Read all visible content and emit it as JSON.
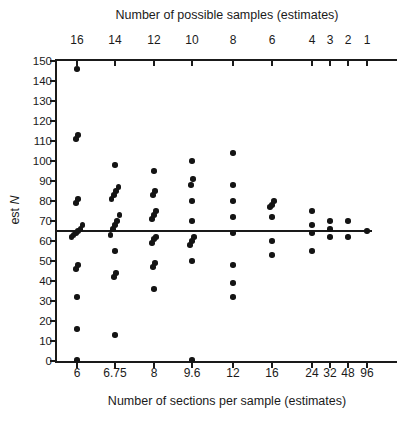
{
  "chart_data": {
    "type": "scatter",
    "top_axis_title": "Number of possible samples (estimates)",
    "bottom_axis_title": "Number of sections per sample (estimates)",
    "ylabel_prefix": "est ",
    "ylabel_symbol": "N",
    "ylim": [
      0,
      150
    ],
    "y_tick_step": 10,
    "y_tick_labels": [
      "0",
      "10",
      "20",
      "30",
      "40",
      "50",
      "60",
      "70",
      "80",
      "90",
      "100",
      "110",
      "120",
      "130",
      "140",
      "150"
    ],
    "top_tick_labels": [
      "16",
      "14",
      "12",
      "10",
      "8",
      "6",
      "4",
      "3",
      "2",
      "1"
    ],
    "bottom_tick_labels": [
      "6",
      "6.75",
      "8",
      "9.6",
      "12",
      "16",
      "24",
      "32",
      "48",
      "96"
    ],
    "reference_line_y": 65,
    "grid": false,
    "point_color": "#141414",
    "series": [
      {
        "sections_per_sample": "6",
        "possible_samples": 16,
        "est_N_values": [
          0.5,
          16,
          32,
          46,
          48,
          62,
          63,
          64,
          65,
          66,
          68,
          79,
          81,
          111,
          113,
          146
        ]
      },
      {
        "sections_per_sample": "6.75",
        "possible_samples": 14,
        "est_N_values": [
          13,
          42,
          44,
          55,
          63,
          66,
          68,
          70,
          73,
          81,
          83,
          85,
          87,
          98
        ]
      },
      {
        "sections_per_sample": "8",
        "possible_samples": 12,
        "est_N_values": [
          36,
          47,
          49,
          59,
          61,
          62,
          71,
          73,
          75,
          83,
          85,
          95
        ]
      },
      {
        "sections_per_sample": "9.6",
        "possible_samples": 10,
        "est_N_values": [
          0.5,
          50,
          58,
          60,
          62,
          70,
          80,
          88,
          91,
          100
        ]
      },
      {
        "sections_per_sample": "12",
        "possible_samples": 8,
        "est_N_values": [
          32,
          39,
          48,
          64,
          72,
          80,
          88,
          104
        ]
      },
      {
        "sections_per_sample": "16",
        "possible_samples": 6,
        "est_N_values": [
          53,
          60,
          72,
          77,
          78,
          80
        ]
      },
      {
        "sections_per_sample": "24",
        "possible_samples": 4,
        "est_N_values": [
          55,
          64,
          68,
          75
        ]
      },
      {
        "sections_per_sample": "32",
        "possible_samples": 3,
        "est_N_values": [
          62,
          66,
          70
        ]
      },
      {
        "sections_per_sample": "48",
        "possible_samples": 2,
        "est_N_values": [
          62,
          70
        ]
      },
      {
        "sections_per_sample": "96",
        "possible_samples": 1,
        "est_N_values": [
          65
        ]
      }
    ],
    "layout": {
      "x_positions_pct": [
        0.0588,
        0.1706,
        0.2853,
        0.3971,
        0.5176,
        0.6324,
        0.75,
        0.8029,
        0.8559,
        0.9118
      ],
      "reference_line_width_pct": 0.926,
      "legend": "none"
    }
  }
}
